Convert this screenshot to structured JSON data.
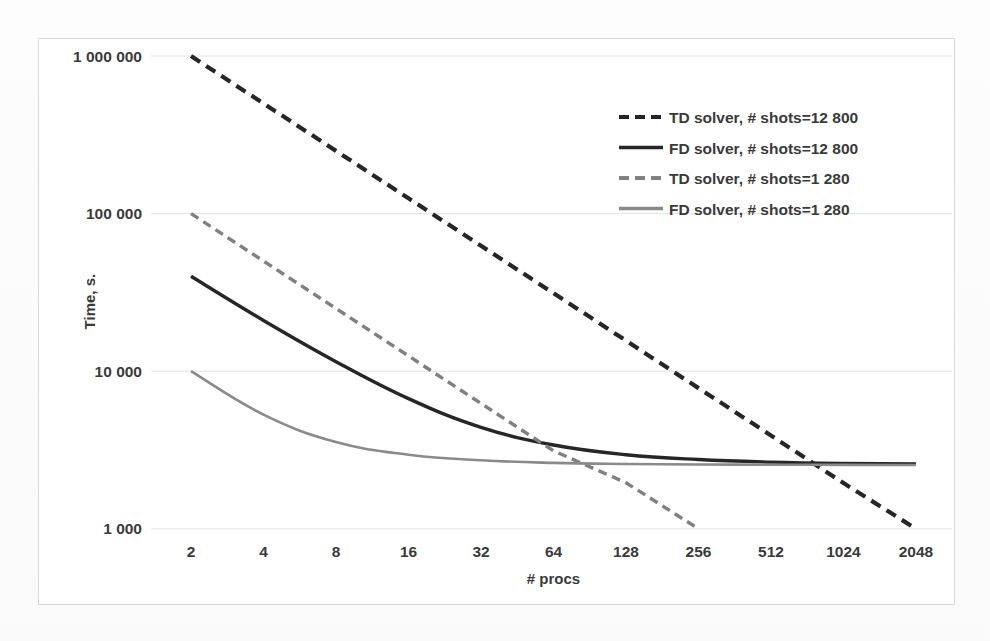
{
  "chart_data": {
    "type": "line",
    "title": "",
    "xlabel": "# procs",
    "ylabel": "Time, s.",
    "xscale": "log2",
    "yscale": "log10",
    "grid": "horizontal",
    "legend_position": "top-right",
    "x": [
      2,
      4,
      8,
      16,
      32,
      64,
      128,
      256,
      512,
      1024,
      2048
    ],
    "xtick_labels": [
      "2",
      "4",
      "8",
      "16",
      "32",
      "64",
      "128",
      "256",
      "512",
      "1024",
      "2048"
    ],
    "ytick_labels": [
      "1 000 000",
      "100 000",
      "10 000",
      "1 000"
    ],
    "ytick_values": [
      1000000,
      100000,
      10000,
      1000
    ],
    "ylim": [
      1000,
      1000000
    ],
    "series": [
      {
        "name": "TD solver, # shots=12 800",
        "style": "dashed",
        "color": "#262626",
        "width": 4.2,
        "x": [
          2,
          4,
          8,
          16,
          32,
          64,
          128,
          256,
          512,
          1024,
          2048
        ],
        "values": [
          1000000,
          500000,
          250000,
          125000,
          62500,
          31250,
          15625,
          7810,
          3910,
          1950,
          1000
        ]
      },
      {
        "name": "FD solver, # shots=12 800",
        "style": "solid",
        "color": "#262626",
        "width": 3.4,
        "x": [
          2,
          4,
          8,
          16,
          32,
          64,
          128,
          256,
          512,
          1024,
          2048
        ],
        "values": [
          40000,
          21000,
          11500,
          6700,
          4400,
          3400,
          2950,
          2750,
          2650,
          2600,
          2580
        ]
      },
      {
        "name": "TD solver, # shots=1 280",
        "style": "dashed",
        "color": "#808080",
        "width": 3.4,
        "x": [
          2,
          4,
          8,
          16,
          32,
          64,
          128,
          256
        ],
        "values": [
          100000,
          50000,
          25000,
          12500,
          6250,
          3125,
          1960,
          1000
        ]
      },
      {
        "name": "FD solver, # shots=1 280",
        "style": "solid",
        "color": "#8a8a8a",
        "width": 2.6,
        "x": [
          2,
          4,
          8,
          16,
          32,
          64,
          128,
          256,
          512,
          1024,
          2048
        ],
        "values": [
          10000,
          5300,
          3550,
          2950,
          2720,
          2620,
          2580,
          2560,
          2550,
          2545,
          2540
        ]
      }
    ]
  },
  "legend": {
    "items": [
      {
        "label": "TD solver, # shots=12 800",
        "style": "dashed",
        "color": "#262626"
      },
      {
        "label": "FD solver, # shots=12 800",
        "style": "solid",
        "color": "#262626"
      },
      {
        "label": "TD solver, # shots=1 280",
        "style": "dashed",
        "color": "#808080"
      },
      {
        "label": "FD solver, # shots=1 280",
        "style": "solid",
        "color": "#8a8a8a"
      }
    ]
  },
  "colors": {
    "dark": "#262626",
    "gray": "#808080",
    "grid": "#e2e2e2",
    "frame": "#d8d8d8",
    "text": "#3a3a3a",
    "background": "#ffffff"
  }
}
